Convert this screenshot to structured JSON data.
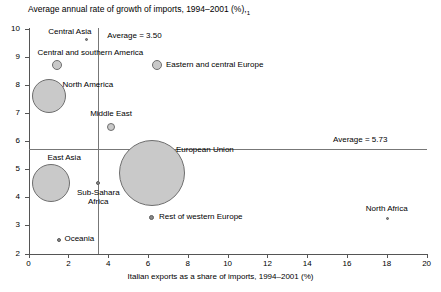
{
  "chart_data": {
    "type": "scatter",
    "title": "",
    "ylabel": "Average annual rate of growth of imports, 1994–2001 (%),",
    "ylabel_superscript": "1",
    "xlabel": "Italian exports as a share of imports, 1994–2001 (%)",
    "xlim": [
      0,
      20
    ],
    "ylim": [
      2,
      10
    ],
    "xticks": [
      "0",
      "2",
      "4",
      "6",
      "8",
      "10",
      "12",
      "14",
      "16",
      "18",
      "20"
    ],
    "yticks": [
      "2",
      "3",
      "4",
      "5",
      "6",
      "7",
      "8",
      "9",
      "10"
    ],
    "grid": false,
    "legend": "none",
    "bubble_size_meaning": "trade volume (relative)",
    "reference_lines": [
      {
        "name": "x-average",
        "orientation": "vertical",
        "value": 3.5,
        "label": "Average = 3.50"
      },
      {
        "name": "y-average",
        "orientation": "horizontal",
        "value": 5.73,
        "label": "Average = 5.73"
      }
    ],
    "points": [
      {
        "name": "Central Asia",
        "x": 2.9,
        "y": 9.6,
        "r_px": 1.5,
        "label": "Central Asia",
        "label_pos": "left"
      },
      {
        "name": "Central and southern America",
        "x": 1.45,
        "y": 8.7,
        "r_px": 5,
        "label": "Central and southern America",
        "label_pos": "above-left"
      },
      {
        "name": "Eastern and central Europe",
        "x": 6.45,
        "y": 8.7,
        "r_px": 5,
        "label": "Eastern and central Europe",
        "label_pos": "right"
      },
      {
        "name": "North America",
        "x": 1.05,
        "y": 7.6,
        "r_px": 17,
        "label": "North America",
        "label_pos": "right"
      },
      {
        "name": "Middle East",
        "x": 4.15,
        "y": 6.5,
        "r_px": 4,
        "label": "Middle East",
        "label_pos": "above"
      },
      {
        "name": "European Union",
        "x": 6.2,
        "y": 4.85,
        "r_px": 33,
        "label": "European Union",
        "label_pos": "right-top"
      },
      {
        "name": "East Asia",
        "x": 1.15,
        "y": 4.5,
        "r_px": 19,
        "label": "East Asia",
        "label_pos": "above-right"
      },
      {
        "name": "Sub-Sahara Africa",
        "x": 3.5,
        "y": 4.5,
        "r_px": 2,
        "label": "Sub-Sahara Africa",
        "label_pos": "below"
      },
      {
        "name": "Rest of western Europe",
        "x": 6.2,
        "y": 3.3,
        "r_px": 2.5,
        "label": "Rest of western Europe",
        "label_pos": "right"
      },
      {
        "name": "North Africa",
        "x": 18.05,
        "y": 3.25,
        "r_px": 1.5,
        "label": "North Africa",
        "label_pos": "above"
      },
      {
        "name": "Oceania",
        "x": 1.55,
        "y": 2.5,
        "r_px": 2,
        "label": "Oceania",
        "label_pos": "right"
      }
    ]
  },
  "labels": {
    "y_axis_title": "Average annual rate of growth of imports, 1994–2001 (%),",
    "y_axis_title_note": "1",
    "x_axis_title": "Italian exports as a share of imports, 1994–2001 (%)",
    "avg_x": "Average = 3.50",
    "avg_y": "Average = 5.73",
    "ytick_10": "10",
    "ytick_9": "9",
    "ytick_8": "8",
    "ytick_7": "7",
    "ytick_6": "6",
    "ytick_5": "5",
    "ytick_4": "4",
    "ytick_3": "3",
    "ytick_2": "2",
    "xtick_0": "0",
    "xtick_2": "2",
    "xtick_4": "4",
    "xtick_6": "6",
    "xtick_8": "8",
    "xtick_10": "10",
    "xtick_12": "12",
    "xtick_14": "14",
    "xtick_16": "16",
    "xtick_18": "18",
    "xtick_20": "20",
    "pt_central_asia": "Central Asia",
    "pt_central_southern_america": "Central and southern America",
    "pt_eastern_central_europe": "Eastern and central Europe",
    "pt_north_america": "North America",
    "pt_middle_east": "Middle East",
    "pt_european_union": "European Union",
    "pt_east_asia": "East Asia",
    "pt_sub_sahara_africa": "Sub-Sahara Africa",
    "pt_rest_western_europe": "Rest of western Europe",
    "pt_north_africa": "North Africa",
    "pt_oceania": "Oceania"
  },
  "colors": {
    "bubble_fill": "#c9c9c9",
    "bubble_stroke": "#6e6e6e",
    "axis": "#555555",
    "reference_line": "#777777",
    "text": "#000000"
  }
}
